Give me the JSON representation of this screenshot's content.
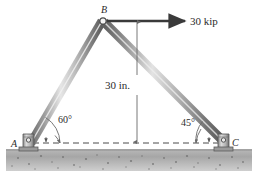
{
  "figure": {
    "type": "statics-truss-free-body-diagram",
    "background_color": "#ffffff",
    "member_color": "#8f8f8f",
    "ground_color": "#a8a8a8",
    "line_color": "#3a3a3a"
  },
  "labels": {
    "joint_b": "B",
    "joint_a": "A",
    "joint_c": "C",
    "applied_force": "30 kip",
    "height_dimension": "30 in.",
    "angle_left": "60°",
    "angle_right": "45°"
  },
  "geometry": {
    "apex_x": 101,
    "apex_y": 20,
    "support_a_x": 30,
    "support_a_y": 143,
    "support_c_x": 226,
    "support_c_y": 143,
    "force_arrow_start_x": 106,
    "force_arrow_end_x": 186,
    "force_arrow_y": 21,
    "dimension_line_x": 137,
    "dimension_top_y": 21,
    "dimension_bottom_y": 143,
    "ground_top_y": 150
  },
  "annotations": {
    "members": [
      {
        "name": "member-ab",
        "from": "A",
        "to": "B",
        "angle_deg": 60
      },
      {
        "name": "member-bc",
        "from": "B",
        "to": "C",
        "angle_deg": 45
      }
    ],
    "loads": [
      {
        "name": "horizontal-load-at-b",
        "magnitude": 30,
        "unit": "kip",
        "direction": "right"
      }
    ],
    "dimensions": [
      {
        "name": "apex-height",
        "value": 30,
        "unit": "in."
      }
    ],
    "supports": [
      {
        "name": "pin-support-a",
        "at": "A"
      },
      {
        "name": "pin-support-c",
        "at": "C"
      }
    ]
  }
}
